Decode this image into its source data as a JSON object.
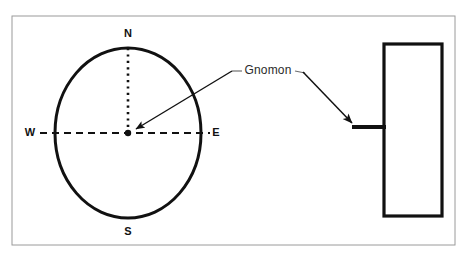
{
  "figure": {
    "name": "gnomon-sundial-diagram",
    "background_color": "#ffffff",
    "border": {
      "name": "figure-frame",
      "color": "#9a9a9a",
      "x": 12,
      "y": 16,
      "width": 443,
      "height": 229,
      "stroke_width": 1
    },
    "ink_color": "#111111",
    "dial": {
      "name": "dial-circle",
      "center_x": 128,
      "center_y": 133,
      "radius_x": 73,
      "radius_y": 85,
      "stroke_width": 3,
      "stroke_color": "#111111",
      "fill": "none"
    },
    "center_point": {
      "name": "dial-center-point",
      "x": 128,
      "y": 133,
      "radius": 3.2,
      "color": "#111111"
    },
    "north_line": {
      "name": "north-dotted-line",
      "x1": 128,
      "y1": 48,
      "x2": 128,
      "y2": 133,
      "style": "dotted",
      "stroke_width": 2.6,
      "color": "#111111"
    },
    "east_west_line": {
      "name": "east-west-dashed-line",
      "x1": 40,
      "y1": 133,
      "x2": 210,
      "y2": 133,
      "style": "dashed",
      "stroke_width": 1.8,
      "color": "#111111"
    },
    "cardinal_points": [
      {
        "id": "north",
        "label": "N",
        "x": 128,
        "y": 34
      },
      {
        "id": "south",
        "label": "S",
        "x": 128,
        "y": 232
      },
      {
        "id": "west",
        "label": "W",
        "x": 30,
        "y": 133
      },
      {
        "id": "east",
        "label": "E",
        "x": 216,
        "y": 133
      }
    ],
    "callout": {
      "name": "gnomon-callout",
      "label": "Gnomon",
      "label_x": 268,
      "label_y": 71,
      "left_leader": {
        "name": "gnomon-leader-left",
        "stub_x1": 232,
        "stub_y1": 71,
        "stub_x2": 241,
        "stub_y2": 71,
        "arrow_x1": 232,
        "arrow_y1": 71,
        "arrow_x2": 134,
        "arrow_y2": 130
      },
      "right_leader": {
        "name": "gnomon-leader-right",
        "stub_x1": 295,
        "stub_y1": 71,
        "stub_x2": 304,
        "stub_y2": 71,
        "arrow_x1": 304,
        "arrow_y1": 73,
        "arrow_x2": 354,
        "arrow_y2": 124
      },
      "arrow_color": "#111111",
      "arrow_stroke_width": 1.4
    },
    "plate": {
      "name": "gnomon-plate-rectangle",
      "x": 384,
      "y": 44,
      "width": 58,
      "height": 172,
      "stroke_width": 3.2,
      "stroke_color": "#111111",
      "fill": "#ffffff"
    },
    "rod": {
      "name": "gnomon-rod",
      "x1": 352,
      "y1": 127,
      "x2": 386,
      "y2": 127,
      "stroke_width": 4.2,
      "color": "#111111"
    }
  }
}
